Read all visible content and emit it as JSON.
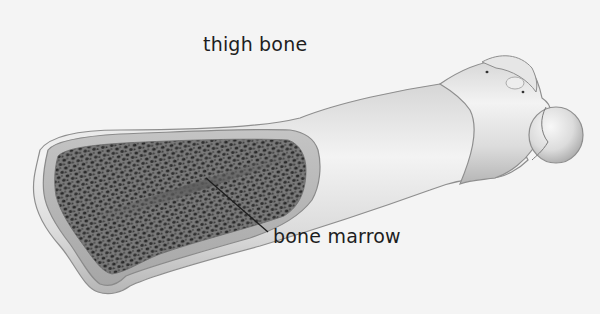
{
  "diagram": {
    "title_label": "thigh bone",
    "callouts": [
      {
        "label": "bone marrow",
        "points_to": "marrow cavity"
      }
    ]
  },
  "colors": {
    "background": "#f4f4f4",
    "bone_light": "#eaeaea",
    "bone_shadow": "#a8a8a8",
    "bone_outline": "#8a8a8a",
    "marrow_cortex": "#b8b8b8",
    "marrow_spongy": "#6e6e6e",
    "marrow_pores": "#2c2c2c",
    "text": "#1e1e1e"
  }
}
